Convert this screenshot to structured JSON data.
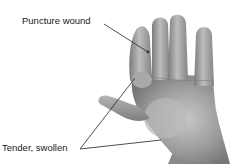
{
  "diagram": {
    "labels": [
      {
        "id": "puncture",
        "text": "Puncture wound"
      },
      {
        "id": "tender",
        "text": "Tender, swollen"
      }
    ]
  },
  "colors": {
    "background": "#ffffff",
    "skin_light": "#c9c9c9",
    "skin_mid": "#9a9a9a",
    "skin_dark": "#6e6e6e",
    "leader_line": "#222222",
    "text": "#1a1a1a"
  }
}
